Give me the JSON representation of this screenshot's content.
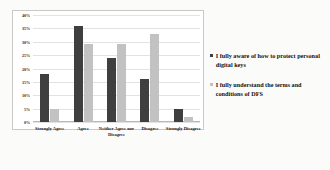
{
  "chart_data": {
    "type": "bar",
    "title": "",
    "xlabel": "",
    "ylabel": "",
    "ylim": [
      0,
      40
    ],
    "ytick_labels": [
      "40%",
      "35%",
      "30%",
      "25%",
      "20%",
      "15%",
      "10%",
      "5%",
      "0%"
    ],
    "ytick_values": [
      40,
      35,
      30,
      25,
      20,
      15,
      10,
      5,
      0
    ],
    "grid": true,
    "legend_position": "right",
    "categories": [
      "Strongly Agree",
      "Agree",
      "Neither Agree nor Disagree",
      "Disagree",
      "Strongly Disagree"
    ],
    "series": [
      {
        "name": "I fully aware of how to protect personal digital keys",
        "color": "#3f3f3f",
        "values": [
          18,
          36,
          24,
          16,
          5
        ]
      },
      {
        "name": "I fully understand the terms and conditions of DFS",
        "color": "#c2c2c2",
        "values": [
          5,
          29,
          29,
          33,
          2
        ]
      }
    ]
  }
}
